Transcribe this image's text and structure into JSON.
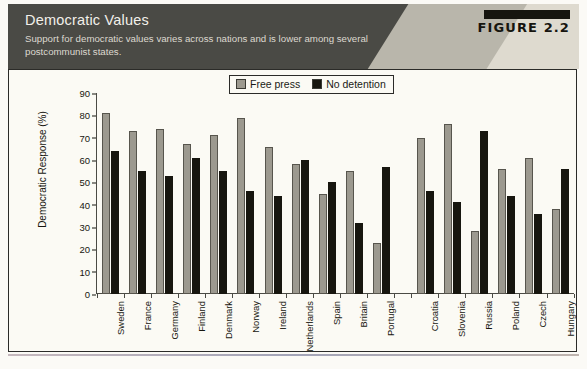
{
  "figure": {
    "title": "Democratic Values",
    "subtitle": "Support for democratic values varies across nations and is lower among several postcommunist states.",
    "number_label": "FIGURE 2.2",
    "source_note": ""
  },
  "legend": {
    "items": [
      {
        "label": "Free press",
        "swatch": "light-gray-square-icon",
        "color": "#9c998f"
      },
      {
        "label": "No detention",
        "swatch": "black-square-icon",
        "color": "#17160f"
      }
    ]
  },
  "colors": {
    "header_band": "#4a4a45",
    "header_accent_mid": "#b9b6ab",
    "header_accent_light": "#dedacf",
    "plot_background": "#fbfaf4",
    "axis": "#4a4a44",
    "free_press_bar": "#9c998f",
    "no_detention_bar": "#17160f"
  },
  "chart_data": {
    "type": "bar",
    "title": "Democratic Values",
    "xlabel": "",
    "ylabel": "Democratic Response (%)",
    "ylim": [
      0,
      90
    ],
    "yticks": [
      0,
      10,
      20,
      30,
      40,
      50,
      60,
      70,
      80,
      90
    ],
    "grid": false,
    "legend_position": "top-center",
    "categories": [
      "Sweden",
      "France",
      "Germany",
      "Finland",
      "Denmark",
      "Norway",
      "Ireland",
      "Netherlands",
      "Spain",
      "Britain",
      "Portugal",
      "Croatia",
      "Slovenia",
      "Russia",
      "Poland",
      "Czech",
      "Hungary"
    ],
    "group_break_after": "Portugal",
    "series": [
      {
        "name": "Free press",
        "color": "#9c998f",
        "values": [
          81,
          73,
          74,
          67,
          71,
          79,
          66,
          58,
          45,
          55,
          23,
          70,
          76,
          28,
          56,
          61,
          38
        ]
      },
      {
        "name": "No detention",
        "color": "#17160f",
        "values": [
          64,
          55,
          53,
          61,
          55,
          46,
          44,
          60,
          50,
          32,
          57,
          46,
          41,
          73,
          44,
          36,
          56
        ]
      }
    ]
  }
}
